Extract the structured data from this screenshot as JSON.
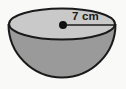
{
  "figure": {
    "name": "hemisphere-bowl-diagram",
    "shape": "hemisphere",
    "background_color": "#f9f9f8",
    "outline_color": "#1a1a1a",
    "top_face_color": "#c9c9c9",
    "body_color": "#9a9a9a",
    "center_dot_color": "#111111",
    "label_color": "#1a1a1a"
  },
  "measurements": {
    "radius": {
      "value": "7",
      "unit": "cm",
      "text": "7 cm"
    }
  },
  "geometry": {
    "opening_center": {
      "x": 62,
      "y": 24
    },
    "opening_rx": 53,
    "opening_ry": 16,
    "bowl_bottom_y": 82,
    "radius_line": {
      "x1": 63,
      "y1": 25,
      "x2": 114,
      "y2": 25
    }
  }
}
